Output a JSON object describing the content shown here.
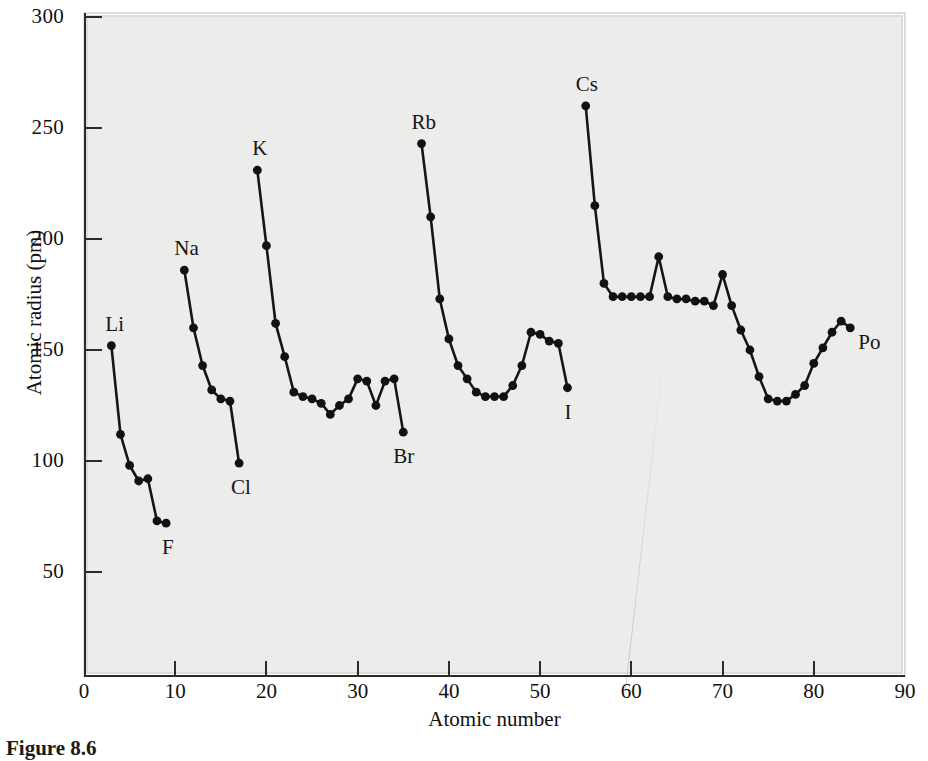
{
  "figure": {
    "caption": "Figure 8.6",
    "background_color": "#ececea",
    "ink_color": "#151515"
  },
  "axes": {
    "x_title": "Atomic number",
    "y_title": "Atomic radius (pm)",
    "x_ticks": [
      0,
      10,
      20,
      30,
      40,
      50,
      60,
      70,
      80,
      90
    ],
    "y_ticks": [
      50,
      100,
      150,
      200,
      250,
      300
    ],
    "xlim": [
      0,
      90
    ],
    "ylim": [
      0,
      300
    ]
  },
  "chart_data": {
    "type": "line",
    "title": "",
    "xlabel": "Atomic number",
    "ylabel": "Atomic radius (pm)",
    "xlim": [
      0,
      90
    ],
    "ylim": [
      0,
      300
    ],
    "grid": false,
    "legend": "none",
    "series": [
      {
        "name": "Period 2",
        "x": [
          3,
          4,
          5,
          6,
          7,
          8,
          9
        ],
        "y": [
          152,
          112,
          98,
          91,
          92,
          73,
          72
        ]
      },
      {
        "name": "Period 3",
        "x": [
          11,
          12,
          13,
          14,
          15,
          16,
          17
        ],
        "y": [
          186,
          160,
          143,
          132,
          128,
          127,
          99
        ]
      },
      {
        "name": "Period 4",
        "x": [
          19,
          20,
          21,
          22,
          23,
          24,
          25,
          26,
          27,
          28,
          29,
          30,
          31,
          32,
          33,
          34,
          35
        ],
        "y": [
          231,
          197,
          162,
          147,
          131,
          129,
          128,
          126,
          121,
          125,
          128,
          137,
          136,
          125,
          136,
          137,
          113
        ]
      },
      {
        "name": "Period 5",
        "x": [
          37,
          38,
          39,
          40,
          41,
          42,
          43,
          44,
          45,
          46,
          47,
          48,
          49,
          50,
          51,
          52,
          53
        ],
        "y": [
          243,
          210,
          173,
          155,
          143,
          137,
          131,
          129,
          129,
          129,
          134,
          143,
          158,
          157,
          154,
          153,
          133
        ]
      },
      {
        "name": "Period 6",
        "x": [
          55,
          56,
          57,
          58,
          59,
          60,
          61,
          62,
          63,
          64,
          65,
          66,
          67,
          68,
          69,
          70,
          71,
          72,
          73,
          74,
          75,
          76,
          77,
          78,
          79,
          80,
          81,
          82,
          83,
          84
        ],
        "y": [
          260,
          215,
          180,
          174,
          174,
          174,
          174,
          174,
          192,
          174,
          173,
          173,
          172,
          172,
          170,
          184,
          170,
          159,
          150,
          138,
          128,
          127,
          127,
          130,
          134,
          144,
          151,
          158,
          163,
          160
        ]
      }
    ],
    "annotations": [
      {
        "label": "Li",
        "x": 3,
        "y": 152,
        "dx": -6,
        "dy": -22
      },
      {
        "label": "F",
        "x": 9,
        "y": 72,
        "dx": -4,
        "dy": 24
      },
      {
        "label": "Na",
        "x": 11,
        "y": 186,
        "dx": -10,
        "dy": -22
      },
      {
        "label": "Cl",
        "x": 17,
        "y": 99,
        "dx": -8,
        "dy": 24
      },
      {
        "label": "K",
        "x": 19,
        "y": 231,
        "dx": -5,
        "dy": -22
      },
      {
        "label": "Br",
        "x": 35,
        "y": 113,
        "dx": -10,
        "dy": 24
      },
      {
        "label": "Rb",
        "x": 37,
        "y": 243,
        "dx": -10,
        "dy": -22
      },
      {
        "label": "I",
        "x": 53,
        "y": 133,
        "dx": -3,
        "dy": 24
      },
      {
        "label": "Cs",
        "x": 55,
        "y": 260,
        "dx": -10,
        "dy": -22
      },
      {
        "label": "Po",
        "x": 84,
        "y": 160,
        "dx": 8,
        "dy": 14
      }
    ]
  }
}
